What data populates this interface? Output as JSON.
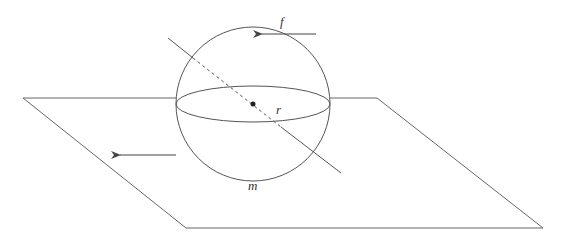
{
  "diagram": {
    "labels": {
      "force": "f",
      "radius": "r",
      "mass": "m"
    },
    "colors": {
      "stroke": "#555555",
      "background": "#ffffff"
    },
    "plane": {
      "points": [
        [
          23,
          98
        ],
        [
          377,
          98
        ],
        [
          543,
          228
        ],
        [
          186,
          228
        ]
      ]
    },
    "sphere": {
      "cx": 253,
      "cy": 104,
      "r": 77,
      "equator_ry": 18
    },
    "axis": {
      "start": [
        168,
        38
      ],
      "dash_start": [
        193,
        58
      ],
      "dash_end": [
        281,
        127
      ],
      "end": [
        341,
        173
      ]
    },
    "arrows": [
      {
        "name": "force-arrow",
        "from": [
          316,
          34
        ],
        "to": [
          259,
          34
        ]
      },
      {
        "name": "plane-motion-arrow",
        "from": [
          176,
          155
        ],
        "to": [
          117,
          155
        ]
      }
    ]
  }
}
